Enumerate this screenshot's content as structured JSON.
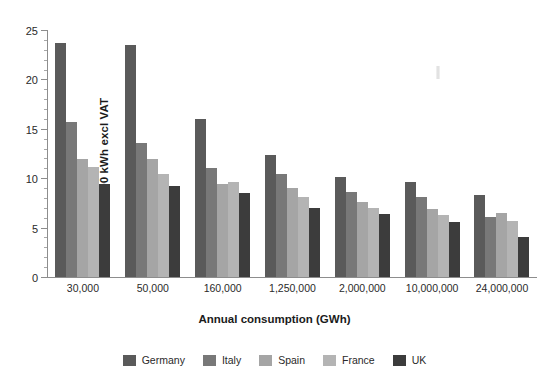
{
  "chart_data": {
    "type": "bar",
    "title": "",
    "xlabel": "Annual consumption (GWh)",
    "ylabel": "ECU/100 kWh excl VAT",
    "ylim": [
      0,
      25
    ],
    "yticks": [
      0,
      5,
      10,
      15,
      20,
      25
    ],
    "grid": false,
    "legend_position": "bottom-center",
    "categories": [
      "30,000",
      "50,000",
      "160,000",
      "1,250,000",
      "2,000,000",
      "10,000,000",
      "24,000,000"
    ],
    "series": [
      {
        "name": "Germany",
        "color": "#5a5a5a",
        "values": [
          23.7,
          23.5,
          16.0,
          12.4,
          10.1,
          9.6,
          8.3
        ]
      },
      {
        "name": "Italy",
        "color": "#787878",
        "values": [
          15.7,
          13.6,
          11.0,
          10.4,
          8.6,
          8.1,
          6.1
        ]
      },
      {
        "name": "Spain",
        "color": "#a5a5a5",
        "values": [
          11.9,
          11.9,
          9.4,
          9.0,
          7.6,
          6.9,
          6.5
        ]
      },
      {
        "name": "France",
        "color": "#b4b4b4",
        "values": [
          11.1,
          10.4,
          9.6,
          8.1,
          7.0,
          6.3,
          5.7
        ]
      },
      {
        "name": "UK",
        "color": "#3c3c3c",
        "values": [
          9.4,
          9.2,
          8.5,
          7.0,
          6.4,
          5.6,
          4.1
        ]
      }
    ]
  },
  "axis": {
    "y_title": "ECU/100 kWh excl VAT",
    "x_title": "Annual consumption (GWh)",
    "y_tick_labels": [
      "0",
      "5",
      "10",
      "15",
      "20",
      "25"
    ],
    "x_tick_labels": [
      "30,000",
      "50,000",
      "160,000",
      "1,250,000",
      "2,000,000",
      "10,000,000",
      "24,000,000"
    ]
  },
  "legend": {
    "items": [
      {
        "label": "Germany",
        "color": "#5a5a5a"
      },
      {
        "label": "Italy",
        "color": "#787878"
      },
      {
        "label": "Spain",
        "color": "#a5a5a5"
      },
      {
        "label": "France",
        "color": "#b4b4b4"
      },
      {
        "label": "UK",
        "color": "#3c3c3c"
      }
    ]
  }
}
